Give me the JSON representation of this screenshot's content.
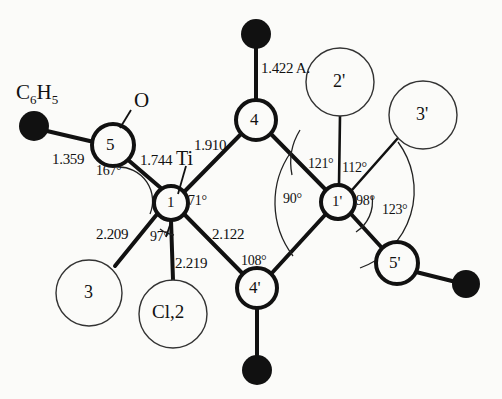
{
  "figure": {
    "type": "molecular-structure-diagram",
    "unit_note": "1.422 A."
  },
  "atoms": [
    {
      "id": "n5",
      "label": "5",
      "x": 113,
      "y": 145,
      "r": 21,
      "style": "bold-open"
    },
    {
      "id": "n4",
      "label": "4",
      "x": 256,
      "y": 120,
      "r": 20,
      "style": "bold-open"
    },
    {
      "id": "ti1",
      "label": "1",
      "x": 171,
      "y": 203,
      "r": 17,
      "style": "bold-open"
    },
    {
      "id": "ti1p",
      "label": "1'",
      "x": 338,
      "y": 202,
      "r": 17,
      "style": "bold-open"
    },
    {
      "id": "n4p",
      "label": "4'",
      "x": 257,
      "y": 288,
      "r": 20,
      "style": "bold-open"
    },
    {
      "id": "n5p",
      "label": "5'",
      "x": 397,
      "y": 263,
      "r": 21,
      "style": "bold-open"
    },
    {
      "id": "n2p",
      "label": "2'",
      "x": 340,
      "y": 82,
      "r": 34,
      "style": "thin-open"
    },
    {
      "id": "n3p",
      "label": "3'",
      "x": 423,
      "y": 115,
      "r": 34,
      "style": "thin-open"
    },
    {
      "id": "n3",
      "label": "3",
      "x": 89,
      "y": 293,
      "r": 33,
      "style": "thin-open"
    },
    {
      "id": "ncl2",
      "label": "Cl,2",
      "x": 173,
      "y": 314,
      "r": 34,
      "style": "thin-open"
    }
  ],
  "filled_atoms": [
    {
      "id": "ph",
      "x": 34,
      "y": 126,
      "r": 15
    },
    {
      "id": "o4",
      "x": 256,
      "y": 34,
      "r": 15
    },
    {
      "id": "o4p",
      "x": 257,
      "y": 370,
      "r": 15
    },
    {
      "id": "o5p",
      "x": 466,
      "y": 284,
      "r": 14
    }
  ],
  "bond_labels": [
    {
      "id": "b-ph-5",
      "text": "1.359",
      "x": 52,
      "y": 152
    },
    {
      "id": "b-5-ti1",
      "text": "1.744",
      "x": 140,
      "y": 155
    },
    {
      "id": "b-ti1-4",
      "text": "1.910",
      "x": 196,
      "y": 140
    },
    {
      "id": "b-4-o",
      "text": "1.422 A.",
      "x": 262,
      "y": 62
    },
    {
      "id": "b-ti1-3",
      "text": "2.209",
      "x": 98,
      "y": 229
    },
    {
      "id": "b-ti1-cl",
      "text": "2.219",
      "x": 176,
      "y": 258
    },
    {
      "id": "b-ti1-4p",
      "text": "2.122",
      "x": 212,
      "y": 229
    }
  ],
  "angle_labels": [
    {
      "id": "a-167",
      "text": "167°",
      "x": 96,
      "y": 165
    },
    {
      "id": "a-71",
      "text": "71°",
      "x": 189,
      "y": 195
    },
    {
      "id": "a-97",
      "text": "97°",
      "x": 152,
      "y": 231
    },
    {
      "id": "a-108",
      "text": "108°",
      "x": 243,
      "y": 255
    },
    {
      "id": "a-121",
      "text": "121°",
      "x": 310,
      "y": 158
    },
    {
      "id": "a-112",
      "text": "112°",
      "x": 342,
      "y": 162
    },
    {
      "id": "a-90",
      "text": "90°",
      "x": 285,
      "y": 193
    },
    {
      "id": "a-98",
      "text": "98°",
      "x": 357,
      "y": 195
    },
    {
      "id": "a-123",
      "text": "123°",
      "x": 383,
      "y": 204
    }
  ],
  "text_labels": {
    "phenyl": {
      "text_html": "C<sub>6</sub>H<sub>5</sub>",
      "x": 16,
      "y": 84
    },
    "oxygen": {
      "text": "O",
      "x": 137,
      "y": 101
    },
    "titanium": {
      "text": "Ti",
      "x": 178,
      "y": 152
    }
  },
  "colors": {
    "background": "#fbfbf9",
    "ink": "#111111",
    "thin_stroke": "#333333"
  },
  "chart_data": {
    "type": "diagram",
    "bond_lengths_angstrom": [
      {
        "from": "C6H5",
        "to": "5",
        "value": 1.359
      },
      {
        "from": "5",
        "to": "Ti1",
        "value": 1.744
      },
      {
        "from": "Ti1",
        "to": "4",
        "value": 1.91
      },
      {
        "from": "4",
        "to": "O",
        "value": 1.422
      },
      {
        "from": "Ti1",
        "to": "3",
        "value": 2.209
      },
      {
        "from": "Ti1",
        "to": "Cl,2",
        "value": 2.219
      },
      {
        "from": "Ti1",
        "to": "4'",
        "value": 2.122
      }
    ],
    "bond_angles_degrees": [
      {
        "id": "167",
        "value": 167
      },
      {
        "id": "71",
        "value": 71
      },
      {
        "id": "97",
        "value": 97
      },
      {
        "id": "108",
        "value": 108
      },
      {
        "id": "121",
        "value": 121
      },
      {
        "id": "112",
        "value": 112
      },
      {
        "id": "90",
        "value": 90
      },
      {
        "id": "98",
        "value": 98
      },
      {
        "id": "123",
        "value": 123
      }
    ]
  }
}
